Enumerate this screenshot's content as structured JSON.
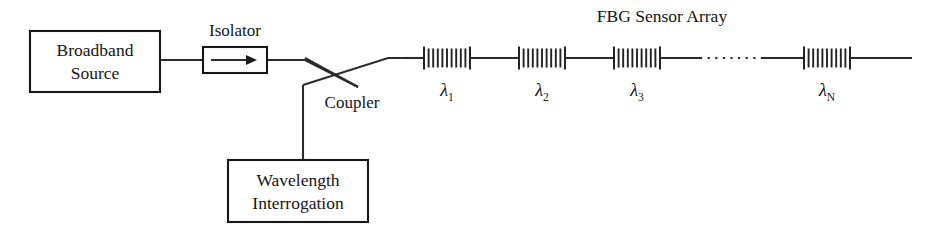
{
  "diagram": {
    "title": "FBG Sensor Array",
    "canvas": {
      "width": 929,
      "height": 240,
      "background": "#ffffff"
    },
    "stroke_color": "#2b2b2b",
    "text_color": "#141414"
  },
  "blocks": {
    "source": {
      "name": "broadband-source",
      "line1": "Broadband",
      "line2": "Source",
      "x": 30,
      "y": 31,
      "width": 130,
      "height": 61
    },
    "interrogation": {
      "name": "wavelength-interrogation",
      "line1": "Wavelength",
      "line2": "Interrogation",
      "x": 228,
      "y": 160,
      "width": 140,
      "height": 62
    },
    "isolator": {
      "name": "isolator",
      "label": "Isolator",
      "x": 203,
      "y": 47,
      "width": 64,
      "height": 26,
      "label_x": 235,
      "label_y": 36
    }
  },
  "coupler": {
    "label": "Coupler",
    "label_x": 352,
    "label_y": 108,
    "cross_x": 340,
    "cross_y": 71
  },
  "fiber": {
    "axis_y": 60,
    "start_x": 160,
    "end_x": 912,
    "drop_x": 303,
    "drop_top_y": 85,
    "drop_bottom_y": 160
  },
  "gratings": [
    {
      "id": "fbg-1",
      "label": "λ",
      "subscript": "1",
      "x_start": 424,
      "x_end": 470,
      "lines": 9
    },
    {
      "id": "fbg-2",
      "label": "λ",
      "subscript": "2",
      "x_start": 519,
      "x_end": 565,
      "lines": 9
    },
    {
      "id": "fbg-3",
      "label": "λ",
      "subscript": "3",
      "x_start": 614,
      "x_end": 660,
      "lines": 9
    },
    {
      "id": "fbg-n",
      "label": "λ",
      "subscript": "N",
      "x_start": 804,
      "x_end": 850,
      "lines": 9
    }
  ],
  "ellipsis": {
    "name": "array-continuation-ellipsis",
    "x_start": 700,
    "x_end": 762,
    "dot_count": 8
  },
  "title_position": {
    "x": 662,
    "y": 22
  }
}
